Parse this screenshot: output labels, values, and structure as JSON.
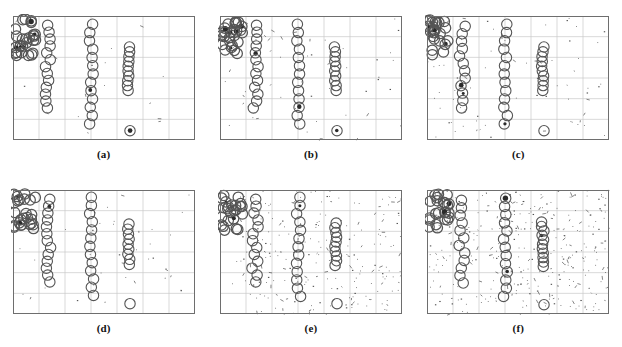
{
  "figure": {
    "type": "multi-panel-scatter-figure",
    "rows": 2,
    "cols": 3,
    "background": "#ffffff",
    "panel_border_color": "#6e6e6e",
    "grid_color": "#c9c9c9",
    "marker_color": "#555555",
    "noise_color": "#333333"
  },
  "chart_data": [
    {
      "id": "a",
      "type": "scatter",
      "caption": "(a)",
      "title": "",
      "xlabel": "",
      "ylabel": "",
      "xlim": [
        0,
        7
      ],
      "ylim": [
        0,
        6
      ],
      "grid": true,
      "grid_x_divisions": 7,
      "grid_y_divisions": 6,
      "legend": "none",
      "noise_level": 0,
      "noise_points": 18,
      "marker": "open-circle",
      "clusters": [
        {
          "name": "cluster-1",
          "x": 0.45,
          "y_from": 5.85,
          "y_to": 4.05,
          "count": 26,
          "x_jitter": 0.42,
          "dense": true
        },
        {
          "name": "cluster-2",
          "x": 1.35,
          "y_from": 5.55,
          "y_to": 1.55,
          "count": 13,
          "x_jitter": 0.12,
          "dense": false
        },
        {
          "name": "cluster-3",
          "x": 3.02,
          "y_from": 5.6,
          "y_to": 0.78,
          "count": 13,
          "x_jitter": 0.08,
          "dense": false
        },
        {
          "name": "cluster-4",
          "x": 4.45,
          "y_from": 4.5,
          "y_to": 2.4,
          "count": 10,
          "x_jitter": 0.05,
          "dense": false
        },
        {
          "name": "outlier-1",
          "x": 4.5,
          "y_from": 0.45,
          "y_to": 0.45,
          "count": 1,
          "x_jitter": 0,
          "dense": false,
          "filled": true
        }
      ]
    },
    {
      "id": "b",
      "type": "scatter",
      "caption": "(b)",
      "title": "",
      "xlabel": "",
      "ylabel": "",
      "xlim": [
        0,
        7
      ],
      "ylim": [
        0,
        6
      ],
      "grid": true,
      "grid_x_divisions": 7,
      "grid_y_divisions": 6,
      "legend": "none",
      "noise_level": 1,
      "noise_points": 55,
      "marker": "open-circle",
      "clusters": [
        {
          "name": "cluster-1",
          "x": 0.45,
          "y_from": 5.85,
          "y_to": 4.05,
          "count": 26,
          "x_jitter": 0.42,
          "dense": true
        },
        {
          "name": "cluster-2",
          "x": 1.35,
          "y_from": 5.55,
          "y_to": 1.55,
          "count": 13,
          "x_jitter": 0.12,
          "dense": false
        },
        {
          "name": "cluster-3",
          "x": 3.02,
          "y_from": 5.6,
          "y_to": 0.78,
          "count": 13,
          "x_jitter": 0.08,
          "dense": false
        },
        {
          "name": "cluster-4",
          "x": 4.45,
          "y_from": 4.5,
          "y_to": 2.4,
          "count": 10,
          "x_jitter": 0.05,
          "dense": false
        },
        {
          "name": "outlier-1",
          "x": 4.5,
          "y_from": 0.45,
          "y_to": 0.45,
          "count": 1,
          "x_jitter": 0,
          "dense": false,
          "filled": true
        }
      ]
    },
    {
      "id": "c",
      "type": "scatter",
      "caption": "(c)",
      "title": "",
      "xlabel": "",
      "ylabel": "",
      "xlim": [
        0,
        7
      ],
      "ylim": [
        0,
        6
      ],
      "grid": true,
      "grid_x_divisions": 7,
      "grid_y_divisions": 6,
      "legend": "none",
      "noise_level": 2,
      "noise_points": 75,
      "marker": "open-circle",
      "clusters": [
        {
          "name": "cluster-1",
          "x": 0.45,
          "y_from": 5.85,
          "y_to": 4.05,
          "count": 24,
          "x_jitter": 0.42,
          "dense": true
        },
        {
          "name": "cluster-2",
          "x": 1.35,
          "y_from": 5.5,
          "y_to": 1.55,
          "count": 12,
          "x_jitter": 0.12,
          "dense": false
        },
        {
          "name": "cluster-3",
          "x": 3.02,
          "y_from": 5.6,
          "y_to": 0.78,
          "count": 13,
          "x_jitter": 0.08,
          "dense": false
        },
        {
          "name": "cluster-4",
          "x": 4.45,
          "y_from": 4.5,
          "y_to": 2.4,
          "count": 10,
          "x_jitter": 0.05,
          "dense": false
        },
        {
          "name": "outlier-1",
          "x": 4.5,
          "y_from": 0.45,
          "y_to": 0.45,
          "count": 1,
          "x_jitter": 0,
          "dense": false,
          "filled": false
        }
      ]
    },
    {
      "id": "d",
      "type": "scatter",
      "caption": "(d)",
      "title": "",
      "xlabel": "",
      "ylabel": "",
      "xlim": [
        0,
        7
      ],
      "ylim": [
        0,
        6
      ],
      "grid": true,
      "grid_x_divisions": 7,
      "grid_y_divisions": 6,
      "legend": "none",
      "noise_level": 1,
      "noise_points": 40,
      "marker": "open-circle",
      "clusters": [
        {
          "name": "cluster-1",
          "x": 0.45,
          "y_from": 5.85,
          "y_to": 4.05,
          "count": 25,
          "x_jitter": 0.42,
          "dense": true
        },
        {
          "name": "cluster-2",
          "x": 1.35,
          "y_from": 5.55,
          "y_to": 1.55,
          "count": 13,
          "x_jitter": 0.12,
          "dense": false
        },
        {
          "name": "cluster-3",
          "x": 3.02,
          "y_from": 5.65,
          "y_to": 0.9,
          "count": 13,
          "x_jitter": 0.08,
          "dense": false
        },
        {
          "name": "cluster-4",
          "x": 4.45,
          "y_from": 4.35,
          "y_to": 2.4,
          "count": 9,
          "x_jitter": 0.05,
          "dense": false
        },
        {
          "name": "outlier-1",
          "x": 4.5,
          "y_from": 0.5,
          "y_to": 0.5,
          "count": 1,
          "x_jitter": 0,
          "dense": false,
          "filled": false
        }
      ]
    },
    {
      "id": "e",
      "type": "scatter",
      "caption": "(e)",
      "title": "",
      "xlabel": "",
      "ylabel": "",
      "xlim": [
        0,
        7
      ],
      "ylim": [
        0,
        6
      ],
      "grid": true,
      "grid_x_divisions": 7,
      "grid_y_divisions": 6,
      "legend": "none",
      "noise_level": 3,
      "noise_points": 240,
      "marker": "open-circle",
      "clusters": [
        {
          "name": "cluster-1",
          "x": 0.45,
          "y_from": 5.85,
          "y_to": 4.05,
          "count": 24,
          "x_jitter": 0.42,
          "dense": true
        },
        {
          "name": "cluster-2",
          "x": 1.35,
          "y_from": 5.55,
          "y_to": 1.55,
          "count": 13,
          "x_jitter": 0.12,
          "dense": false
        },
        {
          "name": "cluster-3",
          "x": 3.02,
          "y_from": 5.65,
          "y_to": 0.85,
          "count": 13,
          "x_jitter": 0.08,
          "dense": false
        },
        {
          "name": "cluster-4",
          "x": 4.45,
          "y_from": 4.4,
          "y_to": 2.35,
          "count": 10,
          "x_jitter": 0.05,
          "dense": false
        },
        {
          "name": "outlier-1",
          "x": 4.5,
          "y_from": 0.5,
          "y_to": 0.5,
          "count": 1,
          "x_jitter": 0,
          "dense": false,
          "filled": false
        }
      ]
    },
    {
      "id": "f",
      "type": "scatter",
      "caption": "(f)",
      "title": "",
      "xlabel": "",
      "ylabel": "",
      "xlim": [
        0,
        7
      ],
      "ylim": [
        0,
        6
      ],
      "grid": true,
      "grid_x_divisions": 7,
      "grid_y_divisions": 6,
      "legend": "none",
      "noise_level": 4,
      "noise_points": 330,
      "marker": "open-circle",
      "clusters": [
        {
          "name": "cluster-1",
          "x": 0.45,
          "y_from": 5.85,
          "y_to": 4.05,
          "count": 23,
          "x_jitter": 0.42,
          "dense": true
        },
        {
          "name": "cluster-2",
          "x": 1.35,
          "y_from": 5.5,
          "y_to": 1.5,
          "count": 12,
          "x_jitter": 0.12,
          "dense": false
        },
        {
          "name": "cluster-3",
          "x": 3.02,
          "y_from": 5.6,
          "y_to": 0.85,
          "count": 13,
          "x_jitter": 0.08,
          "dense": false
        },
        {
          "name": "cluster-4",
          "x": 4.45,
          "y_from": 4.45,
          "y_to": 2.3,
          "count": 11,
          "x_jitter": 0.05,
          "dense": false
        },
        {
          "name": "outlier-1",
          "x": 4.5,
          "y_from": 0.45,
          "y_to": 0.45,
          "count": 1,
          "x_jitter": 0,
          "dense": false,
          "filled": false
        }
      ]
    }
  ]
}
